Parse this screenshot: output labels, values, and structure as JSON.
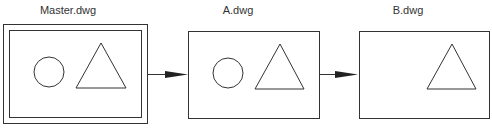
{
  "diagram": {
    "nodes": [
      {
        "id": "master",
        "label": "Master.dwg",
        "shapes": [
          "circle",
          "triangle"
        ],
        "double_border": true
      },
      {
        "id": "a",
        "label": "A.dwg",
        "shapes": [
          "circle",
          "triangle"
        ],
        "double_border": false
      },
      {
        "id": "b",
        "label": "B.dwg",
        "shapes": [
          "triangle"
        ],
        "double_border": false
      }
    ],
    "edges": [
      {
        "from": "master",
        "to": "a"
      },
      {
        "from": "a",
        "to": "b"
      }
    ],
    "colors": {
      "stroke": "#333333",
      "background": "#ffffff"
    }
  }
}
